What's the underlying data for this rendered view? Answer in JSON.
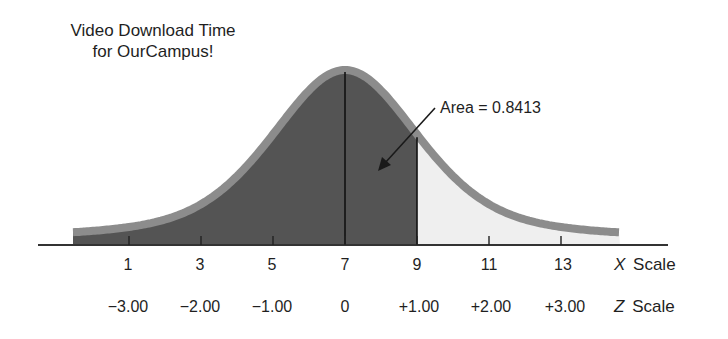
{
  "chart_data": {
    "type": "area",
    "title": "Video Download Time for OurCampus!",
    "title_lines": [
      "Video Download Time",
      "for OurCampus!"
    ],
    "distribution": "normal",
    "mean": 7,
    "std_dev": 2,
    "shaded_region": {
      "from": "-inf",
      "to": 9,
      "label": "Area = 0.8413",
      "area": 0.8413
    },
    "x_scale": {
      "label_italic": "X",
      "label_rest": "Scale",
      "ticks": [
        1,
        3,
        5,
        7,
        9,
        11,
        13
      ],
      "tick_labels": [
        "1",
        "3",
        "5",
        "7",
        "9",
        "11",
        "13"
      ]
    },
    "z_scale": {
      "label_italic": "Z",
      "label_rest": "Scale",
      "ticks": [
        -3,
        -2,
        -1,
        0,
        1,
        2,
        3
      ],
      "tick_labels": [
        "−3.00",
        "−2.00",
        "−1.00",
        "0",
        "+1.00",
        "+2.00",
        "+3.00"
      ]
    },
    "annotation": "Area = 0.8413",
    "colors": {
      "shaded": "#545454",
      "unshaded": "#efefef",
      "curve_outline": "#8c8c8c",
      "axis": "#333333"
    },
    "grid": false,
    "legend": null
  }
}
